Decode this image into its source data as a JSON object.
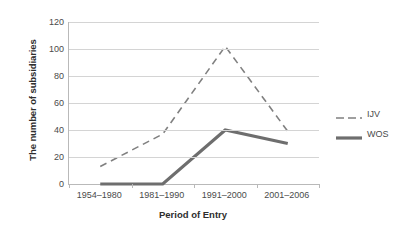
{
  "chart_data": {
    "type": "line",
    "title": "",
    "xlabel": "Period of Entry",
    "ylabel": "The number of subsidiaries",
    "categories": [
      "1954–1980",
      "1981–1990",
      "1991–2000",
      "2001–2006"
    ],
    "series": [
      {
        "name": "IJV",
        "values": [
          13,
          37,
          102,
          39
        ],
        "style": "dashed",
        "color": "#808080",
        "width": 1.6
      },
      {
        "name": "WOS",
        "values": [
          0,
          0,
          40,
          30
        ],
        "style": "solid",
        "color": "#6e6e6e",
        "width": 3.2
      }
    ],
    "ylim": [
      0,
      120
    ],
    "yticks": [
      0,
      20,
      40,
      60,
      80,
      100,
      120
    ],
    "ytick_labels": [
      "0",
      "20",
      "40",
      "60",
      "80",
      "100",
      "120"
    ],
    "grid": "horizontal",
    "legend_position": "right",
    "axis_color": "#b9b9b9",
    "gridline_color": "#d4d4d4",
    "background": "#ffffff"
  },
  "legend": {
    "entries": [
      {
        "label": "IJV"
      },
      {
        "label": "WOS"
      }
    ]
  }
}
